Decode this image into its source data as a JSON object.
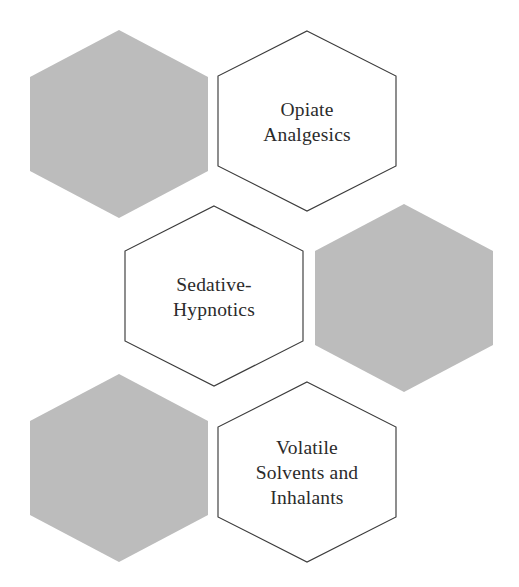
{
  "diagram": {
    "type": "honeycomb-hexagon-diagram",
    "canvas": {
      "width": 519,
      "height": 587,
      "background": "#ffffff"
    },
    "style": {
      "filled_hex_color": "#bcbcbc",
      "outline_hex_fill": "#ffffff",
      "outline_hex_stroke": "#3b3b3b",
      "label_color": "#2b2b2b"
    },
    "hexagons": [
      {
        "id": "hex-top-left-blank",
        "name": "blank-hexagon-top-left",
        "variant": "filled",
        "cx": 119,
        "cy": 124,
        "rx": 89,
        "ry": 94,
        "lines": []
      },
      {
        "id": "hex-opiate-analgesics",
        "name": "hexagon-opiate-analgesics",
        "variant": "outline",
        "cx": 307,
        "cy": 121,
        "rx": 89,
        "ry": 90,
        "lines": [
          "Opiate",
          "Analgesics"
        ]
      },
      {
        "id": "hex-sedative-hypnotics",
        "name": "hexagon-sedative-hypnotics",
        "variant": "outline",
        "cx": 214,
        "cy": 296,
        "rx": 89,
        "ry": 90,
        "lines": [
          "Sedative-",
          "Hypnotics"
        ]
      },
      {
        "id": "hex-mid-right-blank",
        "name": "blank-hexagon-middle-right",
        "variant": "filled",
        "cx": 404,
        "cy": 298,
        "rx": 89,
        "ry": 94,
        "lines": []
      },
      {
        "id": "hex-bottom-left-blank",
        "name": "blank-hexagon-bottom-left",
        "variant": "filled",
        "cx": 119,
        "cy": 468,
        "rx": 89,
        "ry": 94,
        "lines": []
      },
      {
        "id": "hex-volatile-solvents",
        "name": "hexagon-volatile-solvents-and-inhalants",
        "variant": "outline",
        "cx": 307,
        "cy": 472,
        "rx": 89,
        "ry": 90,
        "lines": [
          "Volatile",
          "Solvents and",
          "Inhalants"
        ]
      }
    ]
  }
}
